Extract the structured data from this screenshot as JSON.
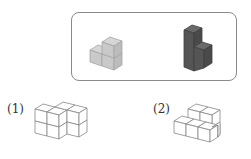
{
  "reference_box": {
    "figures": [
      {
        "name": "light-gray-solid",
        "fill": "#c9c9c9",
        "top": "#d6d6d6",
        "side": "#bcbcbc",
        "stroke": "#a5a5a5"
      },
      {
        "name": "dark-gray-solid",
        "fill": "#555555",
        "top": "#6a6a6a",
        "side": "#4a4a4a",
        "stroke": "#3f3f3f"
      }
    ],
    "border_color": "#8a8a8a"
  },
  "questions": [
    {
      "label": "(1)",
      "stroke": "#888888"
    },
    {
      "label": "(2)",
      "stroke": "#888888"
    }
  ]
}
